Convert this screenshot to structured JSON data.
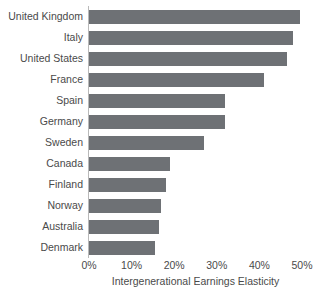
{
  "chart_data": {
    "type": "bar",
    "orientation": "horizontal",
    "title": "",
    "xlabel": "Intergenerational Earnings Elasticity",
    "ylabel": "",
    "categories": [
      "United Kingdom",
      "Italy",
      "United States",
      "France",
      "Spain",
      "Germany",
      "Sweden",
      "Canada",
      "Finland",
      "Norway",
      "Australia",
      "Denmark"
    ],
    "values": [
      49.5,
      48.0,
      46.5,
      41.0,
      32.0,
      32.0,
      27.0,
      19.0,
      18.0,
      17.0,
      16.5,
      15.5
    ],
    "value_unit": "%",
    "xlim": [
      0,
      50
    ],
    "xticks": [
      0,
      10,
      20,
      30,
      40,
      50
    ],
    "xticklabels": [
      "0%",
      "10%",
      "20%",
      "30%",
      "40%",
      "50%"
    ],
    "grid": false,
    "legend": null,
    "bar_color": "#6e7175",
    "axis_color": "#b9b9b9",
    "text_color": "#4a4a4a"
  }
}
